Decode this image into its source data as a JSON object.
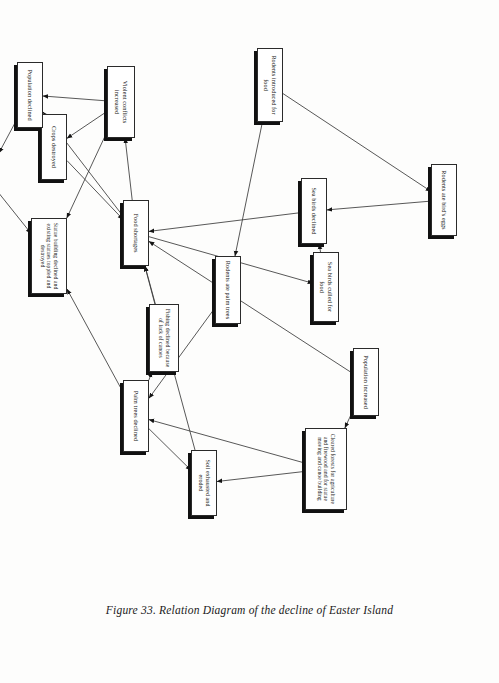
{
  "figure": {
    "caption": "Figure 33. Relation Diagram of the decline of Easter Island",
    "orientation_degrees": 90,
    "box_fill_color": "#ffffff",
    "box_border_color": "#2b2b2b",
    "box_shadow_color": "#111111",
    "edge_color": "#3a3a3a",
    "page_background": "#ffffff"
  },
  "nodes": [
    {
      "id": "rodents_introduced",
      "label": "Rodents introduced for food"
    },
    {
      "id": "rodents_ate_eggs",
      "label": "Rodents ate bird's eggs"
    },
    {
      "id": "sea_birds_declined",
      "label": "Sea birds declined"
    },
    {
      "id": "sea_birds_culled",
      "label": "Sea birds culled for food"
    },
    {
      "id": "rodents_ate_palms",
      "label": "Rodents ate palm trees"
    },
    {
      "id": "population_increased",
      "label": "Population increased"
    },
    {
      "id": "cleared_forests",
      "label": "Cleared forests for agriculture and firewood and for statue moving and canoe building"
    },
    {
      "id": "soil_exhausted",
      "label": "Soil exhausted and eroded"
    },
    {
      "id": "palm_trees_declined",
      "label": "Palm trees declined"
    },
    {
      "id": "fishing_declined",
      "label": "Fishing declined because of lack of canoes"
    },
    {
      "id": "food_shortages",
      "label": "Food shortages"
    },
    {
      "id": "crops_destroyed",
      "label": "Crops destroyed"
    },
    {
      "id": "violent_conflicts",
      "label": "Violent conflicts increased"
    },
    {
      "id": "statue_building",
      "label": "Statue building declined and existing statues toppled and destroyed"
    },
    {
      "id": "religion_collapsed",
      "label": "Religion collapsed"
    },
    {
      "id": "population_declined",
      "label": "Population declined"
    }
  ],
  "edges": [
    {
      "from": "rodents_introduced",
      "to": "rodents_ate_eggs"
    },
    {
      "from": "rodents_ate_eggs",
      "to": "sea_birds_declined"
    },
    {
      "from": "sea_birds_culled",
      "to": "sea_birds_declined"
    },
    {
      "from": "food_shortages",
      "to": "sea_birds_culled"
    },
    {
      "from": "sea_birds_declined",
      "to": "food_shortages"
    },
    {
      "from": "rodents_introduced",
      "to": "rodents_ate_palms"
    },
    {
      "from": "rodents_ate_palms",
      "to": "palm_trees_declined"
    },
    {
      "from": "population_increased",
      "to": "cleared_forests"
    },
    {
      "from": "population_increased",
      "to": "food_shortages"
    },
    {
      "from": "cleared_forests",
      "to": "palm_trees_declined"
    },
    {
      "from": "cleared_forests",
      "to": "soil_exhausted"
    },
    {
      "from": "soil_exhausted",
      "to": "food_shortages"
    },
    {
      "from": "palm_trees_declined",
      "to": "fishing_declined"
    },
    {
      "from": "palm_trees_declined",
      "to": "soil_exhausted"
    },
    {
      "from": "fishing_declined",
      "to": "food_shortages"
    },
    {
      "from": "food_shortages",
      "to": "violent_conflicts"
    },
    {
      "from": "food_shortages",
      "to": "population_declined"
    },
    {
      "from": "violent_conflicts",
      "to": "crops_destroyed"
    },
    {
      "from": "crops_destroyed",
      "to": "food_shortages"
    },
    {
      "from": "violent_conflicts",
      "to": "population_declined"
    },
    {
      "from": "violent_conflicts",
      "to": "statue_building"
    },
    {
      "from": "religion_collapsed",
      "to": "statue_building"
    },
    {
      "from": "population_declined",
      "to": "religion_collapsed"
    },
    {
      "from": "palm_trees_declined",
      "to": "statue_building"
    }
  ]
}
